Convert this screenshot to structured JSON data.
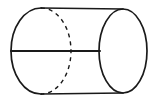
{
  "figure": {
    "type": "geometric-solid-diagram",
    "background_color": "#ffffff",
    "stroke_color": "#1a1a1a",
    "canvas": {
      "width": 157,
      "height": 104
    },
    "elements": {
      "left_ellipse": {
        "name": "left-base-ellipse",
        "center_x": 41,
        "center_y": 51,
        "radius_x": 30,
        "radius_y": 43,
        "visible_half": "left",
        "hidden_half": "right",
        "stroke_width": 1.7,
        "dash_pattern": "4 4",
        "dash_stroke_width": 1.4
      },
      "right_ellipse": {
        "name": "right-base-ellipse",
        "center_x": 123,
        "center_y": 51,
        "radius_x": 24,
        "radius_y": 42,
        "visible_half": "full",
        "stroke_width": 1.7
      },
      "top_edge": {
        "name": "top-side-line",
        "x1": 41,
        "y1": 8,
        "x2": 123,
        "y2": 9,
        "stroke_width": 1.7
      },
      "bottom_edge": {
        "name": "bottom-side-line",
        "x1": 41,
        "y1": 94,
        "x2": 123,
        "y2": 93,
        "stroke_width": 1.7
      },
      "diameter_line": {
        "name": "horizontal-diameter-line",
        "x1": 11,
        "y1": 51,
        "x2": 100,
        "y2": 51,
        "stroke_width": 2.0
      }
    }
  }
}
